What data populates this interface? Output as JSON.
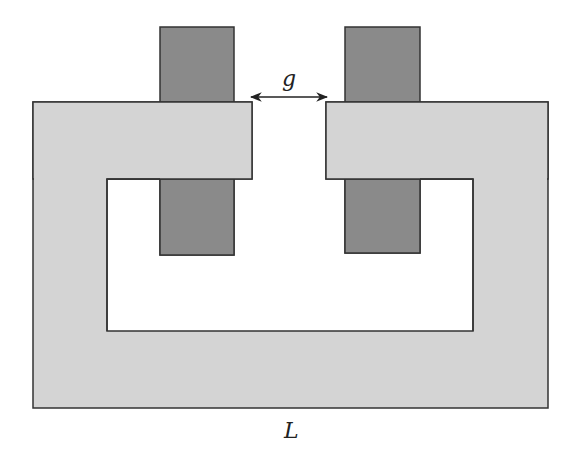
{
  "diagram": {
    "type": "magnetic-core-with-air-gap",
    "labels": {
      "gap": "g",
      "length": "L"
    },
    "colors": {
      "background": "#ffffff",
      "core_fill": "#d4d4d4",
      "coil_fill": "#888888",
      "outline": "#333333",
      "arrow": "#222222"
    },
    "core": {
      "outer": {
        "x": 33,
        "y": 102,
        "w": 515,
        "h": 306
      },
      "window": {
        "x": 107,
        "y": 179,
        "w": 366,
        "h": 152
      },
      "gap": {
        "left_edge": 252,
        "right_edge": 326
      }
    },
    "coils": [
      {
        "name": "left-coil",
        "x": 160,
        "y": 27,
        "w": 74,
        "h": 228
      },
      {
        "name": "right-coil",
        "x": 345,
        "y": 27,
        "w": 75,
        "h": 226
      }
    ],
    "gap_arrow": {
      "x1": 250,
      "x2": 328,
      "y": 97
    }
  }
}
